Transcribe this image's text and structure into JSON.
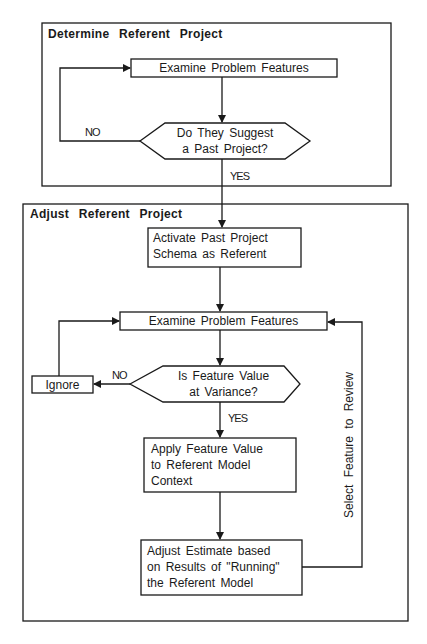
{
  "sections": {
    "determine": {
      "title": "Determine Referent Project"
    },
    "adjust": {
      "title": "Adjust Referent Project"
    }
  },
  "nodes": {
    "examine1": {
      "label": "Examine Problem Features"
    },
    "decision1": {
      "line1": "Do They Suggest",
      "line2": "a Past Project?"
    },
    "activate": {
      "line1": "Activate Past Project",
      "line2": "Schema as Referent"
    },
    "examine2": {
      "label": "Examine Problem Features"
    },
    "decision2": {
      "line1": "Is Feature Value",
      "line2": "at Variance?"
    },
    "ignore": {
      "label": "Ignore"
    },
    "apply": {
      "line1": "Apply Feature Value",
      "line2": "to Referent Model",
      "line3": "Context"
    },
    "adjust_estimate": {
      "line1": "Adjust Estimate based",
      "line2": "on Results of \"Running\"",
      "line3": "the Referent Model"
    }
  },
  "edges": {
    "no1": "NO",
    "yes1": "YES",
    "no2": "NO",
    "yes2": "YES",
    "loop": "Select Feature to Review"
  },
  "colors": {
    "stroke": "#1a1a1a",
    "background": "#ffffff"
  }
}
